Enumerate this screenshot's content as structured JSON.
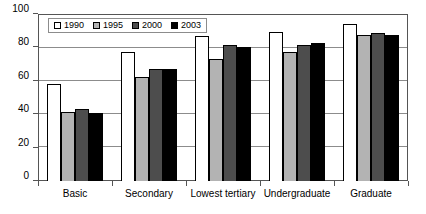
{
  "chart_data": {
    "type": "bar",
    "title": "",
    "subtitle": "",
    "xlabel": "",
    "ylabel": "",
    "ylim": [
      0,
      100
    ],
    "yticks": [
      0,
      20,
      40,
      60,
      80,
      100
    ],
    "grid": true,
    "legend_position": "top-left-inside",
    "categories": [
      "Basic",
      "Secondary",
      "Lowest tertiary",
      "Undergraduate",
      "Graduate"
    ],
    "series": [
      {
        "name": "1990",
        "color": "#ffffff",
        "values": [
          58,
          77.5,
          87,
          89,
          94
        ]
      },
      {
        "name": "1995",
        "color": "#b3b3b3",
        "values": [
          41.5,
          62,
          73,
          77.5,
          87.5
        ]
      },
      {
        "name": "2000",
        "color": "#4d4d4d",
        "values": [
          43,
          67,
          81.5,
          81.5,
          88.5
        ]
      },
      {
        "name": "2003",
        "color": "#000000",
        "values": [
          41,
          67,
          80,
          82.5,
          87.5
        ]
      }
    ]
  },
  "axes": {
    "y_tick_labels": [
      "0",
      "20",
      "40",
      "60",
      "80",
      "100"
    ]
  },
  "legend": {
    "entries": [
      {
        "label": "1990",
        "swatch": "legend-swatch-1990"
      },
      {
        "label": "1995",
        "swatch": "legend-swatch-1995"
      },
      {
        "label": "2000",
        "swatch": "legend-swatch-2000"
      },
      {
        "label": "2003",
        "swatch": "legend-swatch-2003"
      }
    ]
  }
}
